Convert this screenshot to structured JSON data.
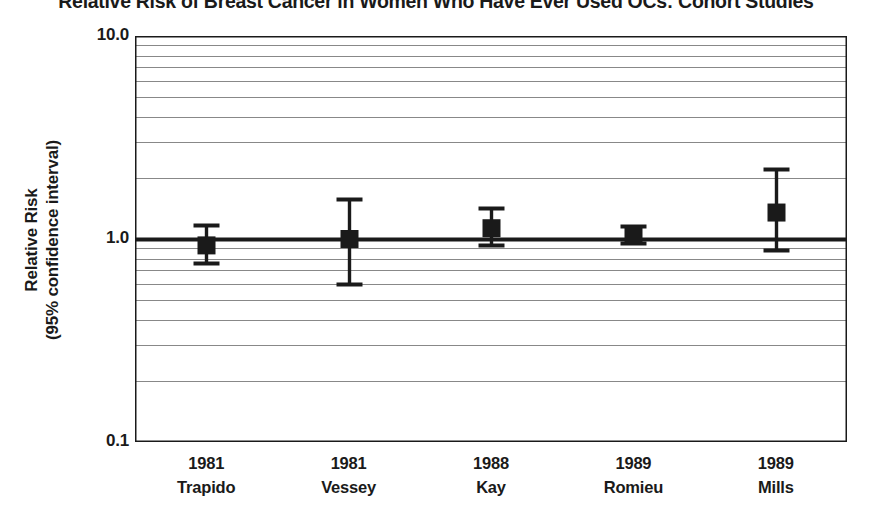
{
  "chart_data": {
    "type": "scatter",
    "subtype": "forest-plot",
    "title": "Relative Risk of Breast Cancer in Women Who Have Ever Used OCs: Cohort Studies",
    "xlabel": "",
    "ylabel_lines": [
      "Relative Risk",
      "(95% confidence interval)"
    ],
    "ylabel": "Relative Risk (95% confidence interval)",
    "yscale": "log",
    "ylim": [
      0.1,
      10.0
    ],
    "ytick_labels": [
      "10.0",
      "1.0",
      "0.1"
    ],
    "ytick_values": [
      10.0,
      1.0,
      0.1
    ],
    "minor_gridlines": [
      9,
      8,
      7,
      6,
      5,
      4,
      3,
      2,
      0.9,
      0.8,
      0.7,
      0.6,
      0.5,
      0.4,
      0.3,
      0.2
    ],
    "grid": true,
    "legend": "none",
    "reference_line": 1.0,
    "categories": [
      "1981 Trapido",
      "1981 Vessey",
      "1988 Kay",
      "1989 Romieu",
      "1989 Mills"
    ],
    "x": [
      {
        "year": "1981",
        "author": "Trapido"
      },
      {
        "year": "1981",
        "author": "Vessey"
      },
      {
        "year": "1988",
        "author": "Kay"
      },
      {
        "year": "1989",
        "author": "Romieu"
      },
      {
        "year": "1989",
        "author": "Mills"
      }
    ],
    "values": [
      0.93,
      1.0,
      1.13,
      1.05,
      1.35
    ],
    "ci_low": [
      0.76,
      0.6,
      0.93,
      0.96,
      0.88
    ],
    "ci_high": [
      1.17,
      1.58,
      1.42,
      1.16,
      2.2
    ],
    "points": [
      {
        "label": "1981 Trapido",
        "year": "1981",
        "author": "Trapido",
        "rr": 0.93,
        "ci_low": 0.76,
        "ci_high": 1.17
      },
      {
        "label": "1981 Vessey",
        "year": "1981",
        "author": "Vessey",
        "rr": 1.0,
        "ci_low": 0.6,
        "ci_high": 1.58
      },
      {
        "label": "1988 Kay",
        "year": "1988",
        "author": "Kay",
        "rr": 1.13,
        "ci_low": 0.93,
        "ci_high": 1.42
      },
      {
        "label": "1989 Romieu",
        "year": "1989",
        "author": "Romieu",
        "rr": 1.05,
        "ci_low": 0.96,
        "ci_high": 1.16
      },
      {
        "label": "1989 Mills",
        "year": "1989",
        "author": "Mills",
        "rr": 1.35,
        "ci_low": 0.88,
        "ci_high": 2.2
      }
    ]
  },
  "colors": {
    "marker": "#1a1a1a",
    "axis": "#1a1a1a",
    "gridline": "#888888",
    "reference_line": "#1a1a1a",
    "background": "#ffffff",
    "text": "#1a1a1a"
  },
  "axis": {
    "ytick_10": "10.0",
    "ytick_1": "1.0",
    "ytick_01": "0.1"
  },
  "ylabel": {
    "line1": "Relative Risk",
    "line2": "(95% confidence interval)"
  },
  "xticks": [
    {
      "year": "1981",
      "author": "Trapido"
    },
    {
      "year": "1981",
      "author": "Vessey"
    },
    {
      "year": "1988",
      "author": "Kay"
    },
    {
      "year": "1989",
      "author": "Romieu"
    },
    {
      "year": "1989",
      "author": "Mills"
    }
  ],
  "title": "Relative Risk of Breast Cancer in Women Who Have Ever Used OCs: Cohort Studies"
}
